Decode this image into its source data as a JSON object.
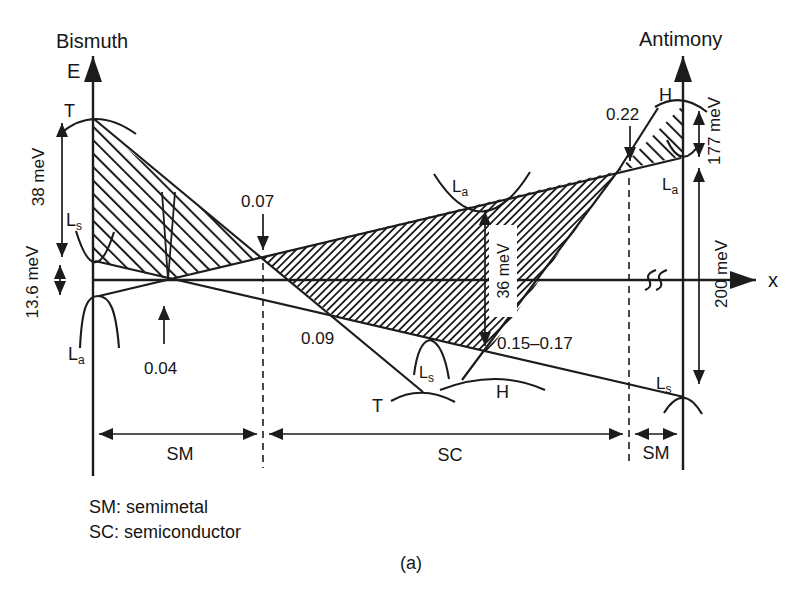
{
  "titles": {
    "left": "Bismuth",
    "right": "Antimony",
    "caption": "(a)"
  },
  "axes": {
    "energy": "E",
    "composition": "x"
  },
  "energies": {
    "bi_overlap": "38 meV",
    "bi_l_gap": "13.6 meV",
    "sc_max_gap": "36 meV",
    "sb_overlap": "177 meV",
    "sb_l_gap": "200 meV"
  },
  "compositions": {
    "band_inversion": "0.04",
    "sm_to_sc": "0.07",
    "t_crossing": "0.09",
    "gap_max_range": "0.15–0.17",
    "sc_to_sm": "0.22"
  },
  "bands": {
    "bi_t": "T",
    "bi_ls": {
      "main": "L",
      "sub": "s"
    },
    "bi_la": {
      "main": "L",
      "sub": "a"
    },
    "sc_la": {
      "main": "L",
      "sub": "a"
    },
    "sc_ls": {
      "main": "L",
      "sub": "s"
    },
    "sc_t": "T",
    "sc_h": "H",
    "sb_h": "H",
    "sb_la": {
      "main": "L",
      "sub": "a"
    },
    "sb_ls": {
      "main": "L",
      "sub": "s"
    }
  },
  "regions": {
    "left": "SM",
    "middle": "SC",
    "right": "SM"
  },
  "legend": {
    "sm": "SM: semimetal",
    "sc": "SC: semiconductor"
  },
  "colors": {
    "ink": "#1c1c1c",
    "background": "#ffffff"
  }
}
